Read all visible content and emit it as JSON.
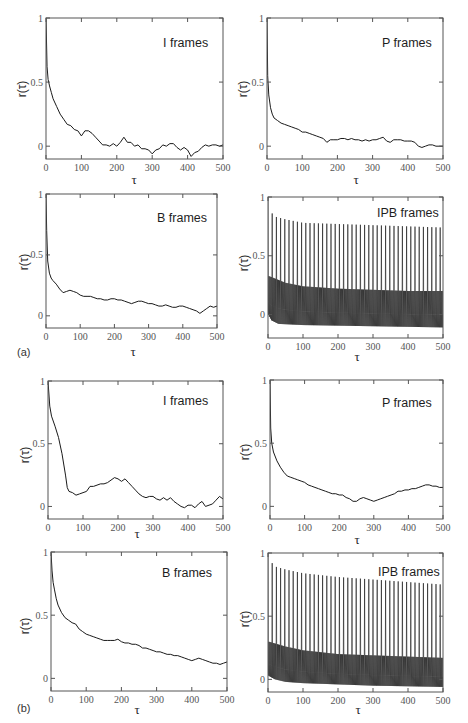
{
  "figure": {
    "panel_labels": {
      "a": "(a)",
      "b": "(b)"
    }
  },
  "chart_data": [
    {
      "panel": "a",
      "type": "line",
      "title": "I frames",
      "xlabel": "τ",
      "ylabel": "r(τ)",
      "xlim": [
        0,
        500
      ],
      "ylim": [
        -0.1,
        1
      ],
      "grid": false,
      "legend": null,
      "xticks": [
        0,
        100,
        200,
        300,
        400,
        500
      ],
      "xtick_labels": [
        "0",
        "100",
        "200",
        "300",
        "400",
        "500"
      ],
      "yticks": [
        0,
        0.5,
        1
      ],
      "ytick_labels": [
        "0",
        "0.5",
        "1"
      ],
      "x": [
        0,
        3,
        6,
        10,
        15,
        20,
        30,
        40,
        50,
        60,
        70,
        80,
        90,
        100,
        110,
        120,
        130,
        140,
        150,
        160,
        170,
        180,
        190,
        200,
        210,
        220,
        230,
        240,
        250,
        260,
        270,
        280,
        290,
        300,
        310,
        320,
        330,
        340,
        350,
        360,
        370,
        380,
        390,
        400,
        410,
        420,
        430,
        440,
        450,
        460,
        470,
        480,
        490,
        500
      ],
      "y": [
        1.0,
        0.62,
        0.52,
        0.47,
        0.42,
        0.37,
        0.31,
        0.25,
        0.21,
        0.17,
        0.16,
        0.13,
        0.12,
        0.08,
        0.12,
        0.12,
        0.1,
        0.07,
        0.04,
        0.01,
        0.01,
        0.0,
        0.02,
        0.0,
        0.03,
        0.07,
        0.03,
        0.03,
        0.0,
        0.01,
        -0.02,
        -0.02,
        -0.03,
        -0.06,
        -0.03,
        -0.02,
        0.01,
        0.0,
        0.02,
        0.02,
        -0.01,
        -0.03,
        -0.01,
        -0.03,
        -0.08,
        -0.05,
        -0.04,
        -0.01,
        0.01,
        0.0,
        0.01,
        0.01,
        0.0,
        0.01
      ]
    },
    {
      "panel": "a",
      "type": "line",
      "title": "P frames",
      "xlabel": "τ",
      "ylabel": "r(τ)",
      "xlim": [
        0,
        500
      ],
      "ylim": [
        -0.1,
        1
      ],
      "grid": false,
      "legend": null,
      "xticks": [
        0,
        100,
        200,
        300,
        400,
        500
      ],
      "xtick_labels": [
        "0",
        "100",
        "200",
        "300",
        "400",
        "500"
      ],
      "yticks": [
        0,
        0.5,
        1
      ],
      "ytick_labels": [
        "0",
        "0.5",
        "1"
      ],
      "x": [
        0,
        2,
        5,
        10,
        15,
        20,
        30,
        40,
        50,
        60,
        70,
        80,
        90,
        100,
        110,
        120,
        130,
        140,
        150,
        160,
        170,
        180,
        190,
        200,
        210,
        220,
        230,
        240,
        250,
        260,
        270,
        280,
        290,
        300,
        310,
        320,
        330,
        340,
        350,
        360,
        370,
        380,
        390,
        400,
        410,
        420,
        430,
        440,
        450,
        460,
        470,
        480,
        490,
        500
      ],
      "y": [
        1.0,
        0.55,
        0.4,
        0.3,
        0.25,
        0.22,
        0.2,
        0.18,
        0.17,
        0.16,
        0.15,
        0.14,
        0.13,
        0.11,
        0.11,
        0.1,
        0.09,
        0.08,
        0.07,
        0.06,
        0.03,
        0.05,
        0.05,
        0.05,
        0.06,
        0.06,
        0.05,
        0.06,
        0.05,
        0.05,
        0.04,
        0.05,
        0.04,
        0.05,
        0.05,
        0.06,
        0.07,
        0.04,
        0.03,
        0.05,
        0.05,
        0.05,
        0.04,
        0.04,
        0.04,
        0.03,
        0.0,
        -0.01,
        0.0,
        0.01,
        0.01,
        0.0,
        0.0,
        0.0
      ]
    },
    {
      "panel": "a",
      "type": "line",
      "title": "B frames",
      "xlabel": "τ",
      "ylabel": "r(τ)",
      "xlim": [
        0,
        500
      ],
      "ylim": [
        -0.1,
        1
      ],
      "grid": false,
      "legend": null,
      "xticks": [
        0,
        100,
        200,
        300,
        400,
        500
      ],
      "xtick_labels": [
        "0",
        "100",
        "200",
        "300",
        "400",
        "500"
      ],
      "yticks": [
        0,
        0.5,
        1
      ],
      "ytick_labels": [
        "0",
        "0.5",
        "1"
      ],
      "x": [
        0,
        2,
        5,
        10,
        15,
        20,
        30,
        40,
        50,
        60,
        70,
        80,
        90,
        100,
        110,
        120,
        130,
        140,
        150,
        160,
        170,
        180,
        190,
        200,
        210,
        220,
        230,
        240,
        250,
        260,
        270,
        280,
        290,
        300,
        310,
        320,
        330,
        340,
        350,
        360,
        370,
        380,
        390,
        400,
        410,
        420,
        430,
        440,
        450,
        460,
        470,
        480,
        490,
        500
      ],
      "y": [
        1.0,
        0.7,
        0.45,
        0.35,
        0.31,
        0.29,
        0.26,
        0.22,
        0.19,
        0.2,
        0.21,
        0.2,
        0.19,
        0.17,
        0.16,
        0.16,
        0.16,
        0.15,
        0.14,
        0.14,
        0.13,
        0.13,
        0.14,
        0.14,
        0.13,
        0.13,
        0.12,
        0.11,
        0.1,
        0.11,
        0.12,
        0.12,
        0.11,
        0.1,
        0.1,
        0.09,
        0.08,
        0.08,
        0.09,
        0.08,
        0.07,
        0.07,
        0.08,
        0.08,
        0.07,
        0.06,
        0.05,
        0.04,
        0.02,
        0.04,
        0.06,
        0.08,
        0.07,
        0.08
      ]
    },
    {
      "panel": "a",
      "type": "line",
      "title": "IPB frames",
      "xlabel": "τ",
      "ylabel": "r(τ)",
      "xlim": [
        0,
        500
      ],
      "ylim": [
        -0.2,
        1
      ],
      "grid": false,
      "legend": null,
      "xticks": [
        0,
        100,
        200,
        300,
        400,
        500
      ],
      "xtick_labels": [
        "0",
        "100",
        "200",
        "300",
        "400",
        "500"
      ],
      "yticks": [
        0,
        0.5,
        1
      ],
      "ytick_labels": [
        "0",
        "0.5",
        "1"
      ],
      "gop_period": 12,
      "peak_envelope": {
        "x": [
          0,
          12,
          24,
          50,
          100,
          200,
          300,
          400,
          500
        ],
        "y": [
          1.0,
          0.86,
          0.83,
          0.81,
          0.78,
          0.77,
          0.76,
          0.75,
          0.74
        ]
      },
      "band_upper": {
        "x": [
          0,
          50,
          100,
          200,
          300,
          400,
          500
        ],
        "y": [
          0.33,
          0.27,
          0.24,
          0.22,
          0.21,
          0.2,
          0.2
        ]
      },
      "band_lower": {
        "x": [
          0,
          10,
          30,
          100,
          300,
          500
        ],
        "y": [
          0.0,
          -0.05,
          -0.08,
          -0.09,
          -0.1,
          -0.11
        ]
      }
    },
    {
      "panel": "b",
      "type": "line",
      "title": "I frames",
      "xlabel": "τ",
      "ylabel": "r(τ)",
      "xlim": [
        0,
        500
      ],
      "ylim": [
        -0.1,
        1
      ],
      "grid": false,
      "legend": null,
      "xticks": [
        0,
        100,
        200,
        300,
        400,
        500
      ],
      "xtick_labels": [
        "0",
        "100",
        "200",
        "300",
        "400",
        "500"
      ],
      "yticks": [
        0,
        0.5,
        1
      ],
      "ytick_labels": [
        "0",
        "0.5",
        "1"
      ],
      "x": [
        0,
        5,
        10,
        20,
        30,
        40,
        50,
        55,
        60,
        70,
        80,
        90,
        100,
        110,
        120,
        130,
        140,
        150,
        160,
        170,
        180,
        190,
        200,
        210,
        220,
        230,
        240,
        250,
        260,
        270,
        280,
        290,
        300,
        310,
        320,
        330,
        340,
        350,
        360,
        370,
        380,
        390,
        400,
        410,
        420,
        430,
        440,
        450,
        460,
        470,
        480,
        490,
        500
      ],
      "y": [
        1.0,
        0.8,
        0.72,
        0.64,
        0.55,
        0.42,
        0.25,
        0.15,
        0.12,
        0.11,
        0.09,
        0.1,
        0.11,
        0.12,
        0.16,
        0.16,
        0.17,
        0.18,
        0.18,
        0.19,
        0.21,
        0.23,
        0.22,
        0.2,
        0.22,
        0.19,
        0.16,
        0.13,
        0.1,
        0.08,
        0.07,
        0.08,
        0.08,
        0.06,
        0.05,
        0.07,
        0.05,
        0.07,
        0.04,
        0.02,
        0.0,
        -0.01,
        0.01,
        0.01,
        -0.01,
        0.02,
        0.04,
        0.0,
        0.01,
        0.02,
        0.05,
        0.08,
        0.06
      ]
    },
    {
      "panel": "b",
      "type": "line",
      "title": "P frames",
      "xlabel": "τ",
      "ylabel": "r(τ)",
      "xlim": [
        0,
        500
      ],
      "ylim": [
        -0.1,
        1
      ],
      "grid": false,
      "legend": null,
      "xticks": [
        0,
        100,
        200,
        300,
        400,
        500
      ],
      "xtick_labels": [
        "0",
        "100",
        "200",
        "300",
        "400",
        "500"
      ],
      "yticks": [
        0,
        0.5,
        1
      ],
      "ytick_labels": [
        "0",
        "0.5",
        "1"
      ],
      "x": [
        0,
        2,
        5,
        10,
        20,
        30,
        40,
        50,
        60,
        70,
        80,
        90,
        100,
        110,
        120,
        130,
        140,
        150,
        160,
        170,
        180,
        190,
        200,
        210,
        220,
        230,
        240,
        250,
        260,
        270,
        280,
        290,
        300,
        310,
        320,
        330,
        340,
        350,
        360,
        370,
        380,
        390,
        400,
        410,
        420,
        430,
        440,
        450,
        460,
        470,
        480,
        490,
        500
      ],
      "y": [
        1.0,
        0.62,
        0.5,
        0.43,
        0.36,
        0.31,
        0.27,
        0.24,
        0.23,
        0.22,
        0.21,
        0.2,
        0.19,
        0.17,
        0.16,
        0.15,
        0.14,
        0.13,
        0.12,
        0.11,
        0.1,
        0.1,
        0.09,
        0.09,
        0.07,
        0.06,
        0.04,
        0.04,
        0.06,
        0.07,
        0.06,
        0.05,
        0.04,
        0.05,
        0.06,
        0.07,
        0.08,
        0.09,
        0.1,
        0.12,
        0.12,
        0.13,
        0.13,
        0.14,
        0.14,
        0.15,
        0.16,
        0.17,
        0.17,
        0.16,
        0.16,
        0.15,
        0.15
      ]
    },
    {
      "panel": "b",
      "type": "line",
      "title": "B frames",
      "xlabel": "τ",
      "ylabel": "r(τ)",
      "xlim": [
        0,
        500
      ],
      "ylim": [
        -0.1,
        1
      ],
      "grid": false,
      "legend": null,
      "xticks": [
        0,
        100,
        200,
        300,
        400,
        500
      ],
      "xtick_labels": [
        "0",
        "100",
        "200",
        "300",
        "400",
        "500"
      ],
      "yticks": [
        0,
        0.5,
        1
      ],
      "ytick_labels": [
        "0",
        "0.5",
        "1"
      ],
      "x": [
        0,
        3,
        6,
        10,
        15,
        20,
        30,
        40,
        50,
        60,
        70,
        80,
        90,
        100,
        110,
        120,
        130,
        140,
        150,
        160,
        170,
        180,
        190,
        200,
        210,
        220,
        230,
        240,
        250,
        260,
        270,
        280,
        290,
        300,
        310,
        320,
        330,
        340,
        350,
        360,
        370,
        380,
        390,
        400,
        410,
        420,
        430,
        440,
        450,
        460,
        470,
        480,
        490,
        500
      ],
      "y": [
        1.0,
        0.85,
        0.76,
        0.7,
        0.63,
        0.58,
        0.52,
        0.48,
        0.46,
        0.44,
        0.43,
        0.39,
        0.37,
        0.35,
        0.34,
        0.33,
        0.32,
        0.31,
        0.3,
        0.3,
        0.3,
        0.3,
        0.31,
        0.29,
        0.28,
        0.28,
        0.27,
        0.27,
        0.26,
        0.24,
        0.24,
        0.23,
        0.22,
        0.21,
        0.21,
        0.2,
        0.19,
        0.19,
        0.18,
        0.18,
        0.17,
        0.16,
        0.15,
        0.14,
        0.15,
        0.16,
        0.15,
        0.14,
        0.13,
        0.12,
        0.12,
        0.11,
        0.12,
        0.13
      ]
    },
    {
      "panel": "b",
      "type": "line",
      "title": "IPB frames",
      "xlabel": "τ",
      "ylabel": "r(τ)",
      "xlim": [
        0,
        500
      ],
      "ylim": [
        -0.1,
        1
      ],
      "grid": false,
      "legend": null,
      "xticks": [
        0,
        100,
        200,
        300,
        400,
        500
      ],
      "xtick_labels": [
        "0",
        "100",
        "200",
        "300",
        "400",
        "500"
      ],
      "yticks": [
        0,
        0.5,
        1
      ],
      "ytick_labels": [
        "0",
        "0.5",
        "1"
      ],
      "gop_period": 12,
      "peak_envelope": {
        "x": [
          0,
          12,
          24,
          50,
          100,
          200,
          300,
          400,
          500
        ],
        "y": [
          1.0,
          0.92,
          0.89,
          0.87,
          0.84,
          0.81,
          0.79,
          0.77,
          0.75
        ]
      },
      "band_upper": {
        "x": [
          0,
          50,
          100,
          200,
          300,
          400,
          500
        ],
        "y": [
          0.3,
          0.26,
          0.23,
          0.2,
          0.19,
          0.18,
          0.17
        ]
      },
      "band_lower": {
        "x": [
          0,
          20,
          50,
          100,
          200,
          300,
          500
        ],
        "y": [
          0.03,
          0.0,
          -0.02,
          -0.03,
          -0.04,
          -0.05,
          -0.06
        ]
      }
    }
  ]
}
